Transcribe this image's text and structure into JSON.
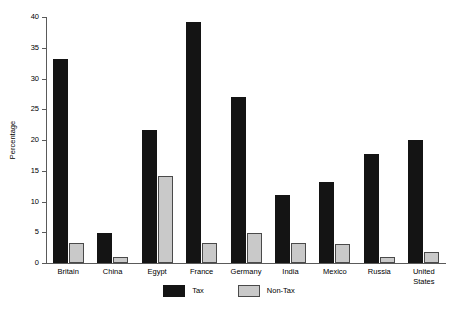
{
  "chart_data": {
    "type": "bar",
    "title": "",
    "xlabel": "",
    "ylabel": "Percentage",
    "ylim": [
      0,
      40
    ],
    "yticks": [
      0,
      5,
      10,
      15,
      20,
      25,
      30,
      35,
      40
    ],
    "grid": false,
    "legend_position": "bottom",
    "categories": [
      "Britain",
      "China",
      "Egypt",
      "France",
      "Germany",
      "India",
      "Mexico",
      "Russia",
      "United\nStates"
    ],
    "series": [
      {
        "name": "Tax",
        "color": "#141414",
        "values": [
          33.2,
          4.9,
          21.6,
          39.2,
          27.0,
          11.1,
          13.2,
          17.7,
          20.0
        ]
      },
      {
        "name": "Non-Tax",
        "color": "#c9c9c9",
        "values": [
          3.3,
          1.0,
          14.2,
          3.3,
          4.8,
          3.2,
          3.1,
          1.0,
          1.8
        ]
      }
    ]
  },
  "axis": {
    "y_label": "Percentage",
    "tick_labels": [
      "40",
      "35",
      "30",
      "25",
      "20",
      "15",
      "10",
      "5",
      "0"
    ]
  },
  "legend": {
    "items": [
      {
        "label": "Tax",
        "color": "#141414"
      },
      {
        "label": "Non-Tax",
        "color": "#c9c9c9"
      }
    ]
  }
}
